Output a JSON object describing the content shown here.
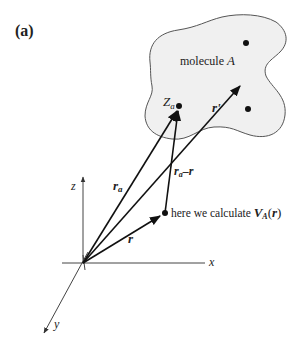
{
  "panel_label": "(a)",
  "molecule": {
    "label_prefix": "molecule ",
    "label_name": "A",
    "fill": "#f0f0f0",
    "stroke": "#555555"
  },
  "axes": {
    "x": "x",
    "y": "y",
    "z": "z"
  },
  "vectors": {
    "r_a": {
      "main": "r",
      "sub": "a"
    },
    "r_prime": "r'",
    "r": "r",
    "r_a_minus_r": {
      "main": "r",
      "sub": "a",
      "rest": "–r"
    }
  },
  "nucleus_label": {
    "main": "Z",
    "sub": "a"
  },
  "calc_point_label": {
    "prefix": "here we calculate ",
    "func": "V",
    "func_sub": "A",
    "arg_open": "(",
    "arg": "r",
    "arg_close": ")"
  }
}
